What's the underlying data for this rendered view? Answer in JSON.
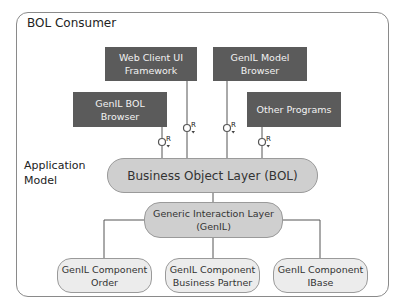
{
  "title": "BOL Consumer",
  "side_label": "Application\nModel",
  "consumers": [
    {
      "id": "web-client-ui-framework",
      "label": "Web Client UI\nFramework"
    },
    {
      "id": "genil-model-browser",
      "label": "GenIL Model\nBrowser"
    },
    {
      "id": "genil-bol-browser",
      "label": "GenIL BOL\nBrowser"
    },
    {
      "id": "other-programs",
      "label": "Other Programs"
    }
  ],
  "interface_label": "R",
  "bol": {
    "label": "Business Object Layer (BOL)"
  },
  "genil": {
    "label": "Generic Interaction Layer\n(GenIL)"
  },
  "components": [
    {
      "id": "order",
      "label": "GenIL Component\nOrder"
    },
    {
      "id": "business-partner",
      "label": "GenIL Component\nBusiness Partner"
    },
    {
      "id": "ibase",
      "label": "GenIL Component\nIBase"
    }
  ],
  "colors": {
    "consumer_box": "#5b5b5b",
    "bol_fill": "#cfcfcf",
    "component_fill": "#ececec",
    "frame": "#8a8a8a"
  }
}
